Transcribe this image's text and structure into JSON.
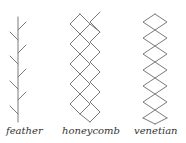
{
  "figure": {
    "patterns": [
      {
        "id": "feather",
        "label": "feather"
      },
      {
        "id": "honeycomb",
        "label": "honeycomb"
      },
      {
        "id": "venetian",
        "label": "venetian"
      }
    ],
    "stroke_color": "#7a7a7a",
    "background": "#ffffff"
  }
}
